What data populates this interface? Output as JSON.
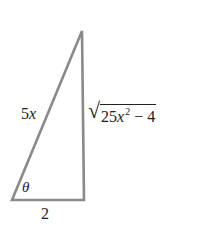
{
  "diagram": {
    "type": "right-triangle",
    "stroke_color": "#8a8a8a",
    "text_color": "#222222",
    "vertices": {
      "apex": [
        82,
        31
      ],
      "bottom_left": [
        12,
        200
      ],
      "bottom_right": [
        84,
        200
      ]
    },
    "labels": {
      "hypotenuse": {
        "coefficient": "5",
        "variable": "x"
      },
      "vertical_side": {
        "radical": "√",
        "coefficient": "25",
        "variable": "x",
        "exponent": "2",
        "operator": " − ",
        "constant": "4"
      },
      "angle": "θ",
      "base": "2"
    }
  }
}
